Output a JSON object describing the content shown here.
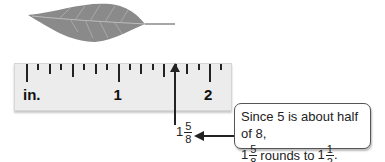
{
  "ruler": {
    "unit_label": "in.",
    "major_labels": [
      "1",
      "2"
    ],
    "divisions_per_inch": 8
  },
  "marker": {
    "whole": "1",
    "numerator": "5",
    "denominator": "8"
  },
  "callout": {
    "line1": "Since 5 is about half of 8,",
    "mixed_whole": "1",
    "mixed_num": "5",
    "mixed_den": "8",
    "middle_text": "rounds to",
    "result_whole": "1",
    "result_num": "1",
    "result_den": "2",
    "end": "."
  },
  "colors": {
    "ruler_bg": "#ececec",
    "leaf": "#8a8a8a",
    "ink": "#222222"
  }
}
